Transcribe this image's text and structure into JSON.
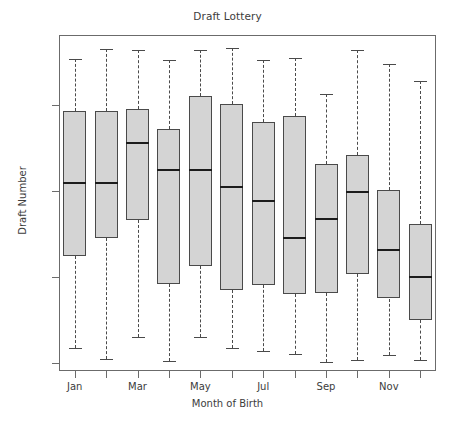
{
  "chart_data": {
    "type": "box",
    "title": "Draft Lottery",
    "xlabel": "Month of Birth",
    "ylabel": "Draft Number",
    "ylim": [
      0,
      366
    ],
    "yticks": [
      0,
      100,
      200,
      300
    ],
    "ytick_labels": [
      "0",
      "100",
      "200",
      "300"
    ],
    "grid": false,
    "legend": "none",
    "categories": [
      "Jan",
      "Feb",
      "Mar",
      "Apr",
      "May",
      "Jun",
      "Jul",
      "Aug",
      "Sep",
      "Oct",
      "Nov",
      "Dec"
    ],
    "xtick_labels": [
      "Jan",
      "Mar",
      "May",
      "Jul",
      "Sep",
      "Nov"
    ],
    "xtick_categories": [
      "Jan",
      "Mar",
      "May",
      "Jul",
      "Sep",
      "Nov"
    ],
    "boxes": [
      {
        "category": "Jan",
        "whisker_low": 17,
        "q1": 124,
        "median": 209,
        "q3": 293,
        "whisker_high": 354
      },
      {
        "category": "Feb",
        "whisker_low": 5,
        "q1": 145,
        "median": 209,
        "q3": 293,
        "whisker_high": 365
      },
      {
        "category": "Mar",
        "whisker_low": 30,
        "q1": 166,
        "median": 256,
        "q3": 295,
        "whisker_high": 364
      },
      {
        "category": "Apr",
        "whisker_low": 2,
        "q1": 92,
        "median": 224,
        "q3": 272,
        "whisker_high": 352
      },
      {
        "category": "May",
        "whisker_low": 30,
        "q1": 113,
        "median": 225,
        "q3": 311,
        "whisker_high": 364
      },
      {
        "category": "Jun",
        "whisker_low": 18,
        "q1": 85,
        "median": 205,
        "q3": 301,
        "whisker_high": 366
      },
      {
        "category": "Jul",
        "whisker_low": 14,
        "q1": 91,
        "median": 188,
        "q3": 280,
        "whisker_high": 352
      },
      {
        "category": "Aug",
        "whisker_low": 11,
        "q1": 80,
        "median": 145,
        "q3": 287,
        "whisker_high": 355
      },
      {
        "category": "Sep",
        "whisker_low": 1,
        "q1": 81,
        "median": 167,
        "q3": 231,
        "whisker_high": 313
      },
      {
        "category": "Oct",
        "whisker_low": 4,
        "q1": 104,
        "median": 199,
        "q3": 242,
        "whisker_high": 364
      },
      {
        "category": "Nov",
        "whisker_low": 9,
        "q1": 75,
        "median": 131,
        "q3": 201,
        "whisker_high": 348
      },
      {
        "category": "Dec",
        "whisker_low": 3,
        "q1": 50,
        "median": 100,
        "q3": 162,
        "whisker_high": 328
      }
    ],
    "colors": {
      "box_fill": "#d4d4d4",
      "box_edge": "#4a4a4a",
      "median": "#1c1c1c",
      "whisker": "#4a4a4a",
      "frame": "#6b6b6b",
      "text": "#3c3c3c",
      "background": "#ffffff"
    }
  }
}
